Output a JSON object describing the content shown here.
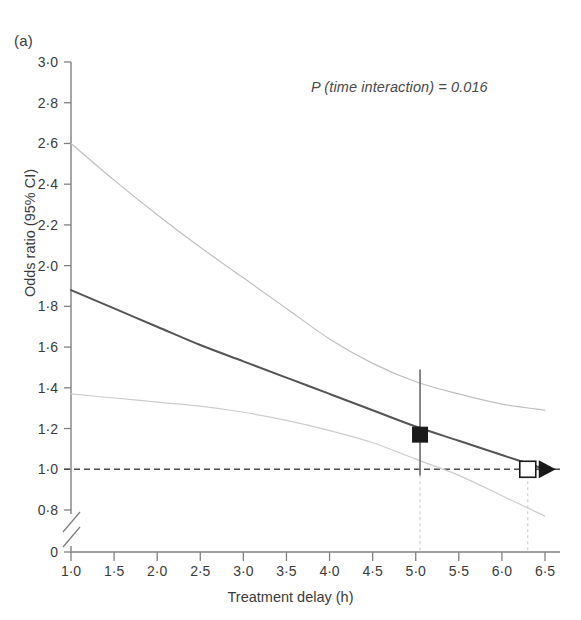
{
  "panel": {
    "label": "(a)"
  },
  "annotation": {
    "pvalue_text": "P (time interaction) = 0.016"
  },
  "axes": {
    "ylabel": "Odds ratio (95% CI)",
    "xlabel": "Treatment delay (h)"
  },
  "chart_data": {
    "type": "line",
    "title": "",
    "subtitle": "",
    "xlabel": "Treatment delay (h)",
    "ylabel": "Odds ratio (95% CI)",
    "xlim": [
      1.0,
      6.5
    ],
    "ylim": [
      0.8,
      3.0
    ],
    "y_axis_break": true,
    "y_axis_break_to": 0,
    "grid": false,
    "legend": "none",
    "xticks": [
      "1·0",
      "1·5",
      "2·0",
      "2·5",
      "3·0",
      "3·5",
      "4·0",
      "4·5",
      "5·0",
      "5·5",
      "6·0",
      "6·5"
    ],
    "xtick_values": [
      1.0,
      1.5,
      2.0,
      2.5,
      3.0,
      3.5,
      4.0,
      4.5,
      5.0,
      5.5,
      6.0,
      6.5
    ],
    "yticks": [
      "0",
      "0·8",
      "1·0",
      "1·2",
      "1·4",
      "1·6",
      "1·8",
      "2·0",
      "2·2",
      "2·4",
      "2·6",
      "2·8",
      "3·0"
    ],
    "ytick_values": [
      0,
      0.8,
      1.0,
      1.2,
      1.4,
      1.6,
      1.8,
      2.0,
      2.2,
      2.4,
      2.6,
      2.8,
      3.0
    ],
    "reference_line": {
      "y": 1.0,
      "style": "dashed",
      "color": "#4d4d4d"
    },
    "x": [
      1.0,
      1.5,
      2.0,
      2.5,
      3.0,
      3.5,
      4.0,
      4.5,
      5.0,
      5.5,
      6.0,
      6.5
    ],
    "series": [
      {
        "name": "Odds ratio (point estimate)",
        "role": "central",
        "color": "#555555",
        "values": [
          1.88,
          1.79,
          1.7,
          1.61,
          1.53,
          1.45,
          1.37,
          1.29,
          1.21,
          1.14,
          1.07,
          1.0
        ]
      },
      {
        "name": "Upper 95% CI",
        "role": "upper",
        "color": "#bfbfbf",
        "values": [
          2.6,
          2.42,
          2.25,
          2.09,
          1.94,
          1.79,
          1.64,
          1.52,
          1.43,
          1.37,
          1.32,
          1.29
        ]
      },
      {
        "name": "Lower 95% CI",
        "role": "lower",
        "color": "#cccccc",
        "values": [
          1.37,
          1.35,
          1.33,
          1.31,
          1.28,
          1.24,
          1.19,
          1.13,
          1.05,
          0.97,
          0.87,
          0.77
        ]
      }
    ],
    "markers": [
      {
        "name": "filled-square-marker",
        "style": "filled-square",
        "x": 5.05,
        "y": 1.17,
        "errorbar_low": 0.97,
        "errorbar_high": 1.49,
        "color": "#1a1a1a"
      },
      {
        "name": "open-square-marker",
        "style": "open-square",
        "x": 6.3,
        "y": 1.0,
        "arrow": "right",
        "color": "#1a1a1a"
      }
    ],
    "droplines": [
      {
        "x": 5.05,
        "from_y": 1.0,
        "to_axis": true
      },
      {
        "x": 6.3,
        "from_y": 1.0,
        "to_axis": true
      }
    ],
    "annotations": [
      "P (time interaction) = 0.016"
    ]
  }
}
